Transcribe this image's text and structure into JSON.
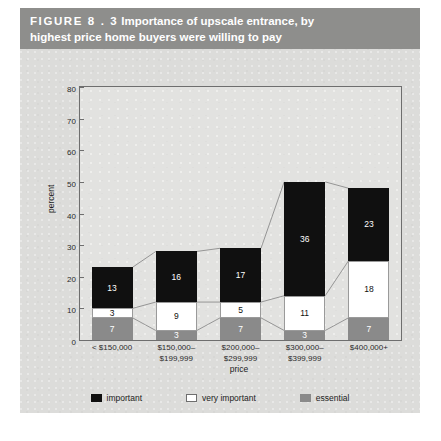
{
  "figure": {
    "number": "FIGURE  8 . 3",
    "title_line1": "Importance of upscale entrance, by",
    "title_line2": "highest price home buyers were willing to pay",
    "banner_color": "#8e8e8c",
    "background_color": "#dcdcda"
  },
  "chart_data": {
    "type": "bar",
    "stacked": true,
    "title": "Importance of upscale entrance, by highest price home buyers were willing to pay",
    "xlabel": "price",
    "ylabel": "percent",
    "ylim": [
      0,
      80
    ],
    "yticks": [
      0,
      10,
      20,
      30,
      40,
      50,
      60,
      70,
      80
    ],
    "grid": false,
    "legend_position": "bottom",
    "categories": [
      "< $150,000",
      "$150,000–$199,999",
      "$200,000–$299,999",
      "$300,000–$399,999",
      "$400,000+"
    ],
    "category_lines": [
      [
        "< $150,000",
        ""
      ],
      [
        "$150,000–",
        "$199,999"
      ],
      [
        "$200,000–",
        "$299,999"
      ],
      [
        "$300,000–",
        "$399,999"
      ],
      [
        "$400,000+",
        ""
      ]
    ],
    "series": [
      {
        "name": "essential",
        "color": "#8a8a8a",
        "values": [
          7,
          3,
          7,
          3,
          7
        ]
      },
      {
        "name": "very important",
        "color": "#ffffff",
        "values": [
          3,
          9,
          5,
          11,
          18
        ]
      },
      {
        "name": "important",
        "color": "#101010",
        "values": [
          13,
          16,
          17,
          36,
          23
        ]
      }
    ],
    "totals": [
      23,
      28,
      29,
      50,
      48
    ]
  },
  "legend": {
    "items": [
      {
        "label": "important",
        "color": "#101010"
      },
      {
        "label": "very important",
        "color": "#ffffff"
      },
      {
        "label": "essential",
        "color": "#8a8a8a"
      }
    ]
  }
}
